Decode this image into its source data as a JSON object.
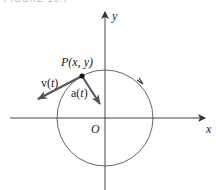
{
  "figure": {
    "caption": "FIGURE 10.7"
  },
  "diagram": {
    "axes": {
      "x_label": "x",
      "y_label": "y",
      "origin_label": "O"
    },
    "point_label": "P(x, y)",
    "velocity_label_prefix": "v(",
    "velocity_label_var": "t",
    "velocity_label_suffix": ")",
    "acceleration_label_prefix": "a(",
    "acceleration_label_var": "t",
    "acceleration_label_suffix": ")",
    "colors": {
      "stroke": "#444444",
      "vector": "#555555",
      "text": "#222222"
    }
  }
}
